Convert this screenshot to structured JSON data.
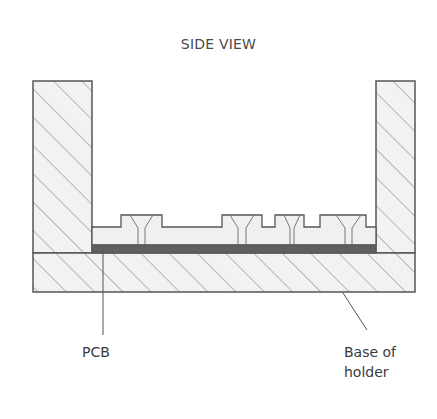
{
  "title": "SIDE VIEW",
  "labels": {
    "pcb": "PCB",
    "base_line1": "Base of",
    "base_line2": "holder"
  },
  "colors": {
    "outline": "#555555",
    "hatch_fill": "#f2f2f2",
    "hatch_line": "#7a7a7a",
    "pcb": "#5f5f5f",
    "tray_fill": "#f0f0f0",
    "text": "#3a3a3a"
  },
  "parts": [
    {
      "name": "left wall",
      "type": "hatched"
    },
    {
      "name": "right wall",
      "type": "hatched"
    },
    {
      "name": "base of holder",
      "type": "hatched"
    },
    {
      "name": "pcb",
      "type": "solid"
    },
    {
      "name": "component tray",
      "type": "outline"
    }
  ]
}
